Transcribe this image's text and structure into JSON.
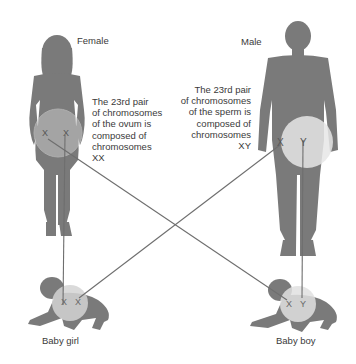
{
  "diagram": {
    "type": "sex-determination-inheritance",
    "colors": {
      "silhouette": "#7a7a7a",
      "highlight_circle": "#d9d9d9",
      "line": "#6e6e6e",
      "text": "#3a3a3a",
      "background": "#ffffff"
    },
    "female": {
      "label": "Female",
      "description_lines": [
        "The 23rd pair",
        "of chromosomes",
        "of the ovum is",
        "composed of",
        "chromosomes",
        "XX"
      ],
      "chromosomes": [
        "X",
        "X"
      ]
    },
    "male": {
      "label": "Male",
      "description_lines": [
        "The 23rd pair",
        "of chromosomes",
        "of the sperm is",
        "composed of",
        "chromosomes",
        "XY"
      ],
      "chromosomes": [
        "X",
        "Y"
      ]
    },
    "baby_girl": {
      "label": "Baby girl",
      "chromosomes": [
        "X",
        "X"
      ]
    },
    "baby_boy": {
      "label": "Baby boy",
      "chromosomes": [
        "X",
        "Y"
      ]
    },
    "connections": [
      {
        "from": "female.X1",
        "to": "baby_boy.X"
      },
      {
        "from": "female.X2",
        "to": "baby_girl.X1"
      },
      {
        "from": "male.X",
        "to": "baby_girl.X2"
      },
      {
        "from": "male.Y",
        "to": "baby_boy.Y"
      }
    ]
  }
}
